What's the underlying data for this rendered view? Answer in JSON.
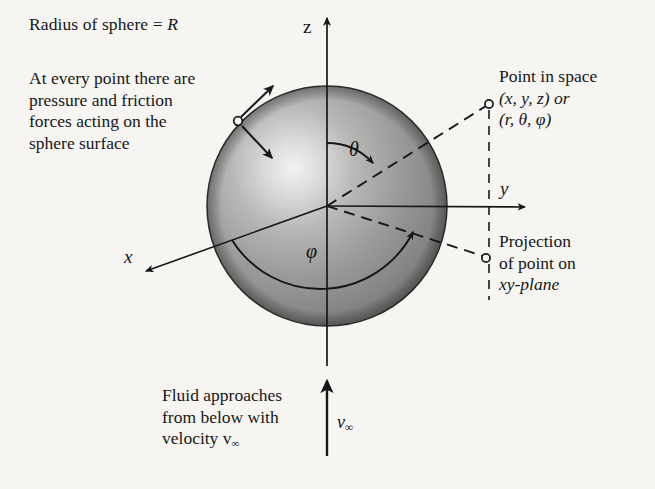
{
  "figure": {
    "background_color": "#f6f5f1",
    "ink_color": "#17171a"
  },
  "annotations": {
    "radius_note": "Radius of sphere = ",
    "radius_symbol": "R",
    "surface_note_lines": [
      "At every point there are",
      "pressure and friction",
      "forces acting on the",
      "sphere surface"
    ],
    "point_note_lines": [
      "Point in space",
      "(x, y, z) or",
      "(r, θ, φ)"
    ],
    "projection_note_lines": [
      "Projection",
      "of point on",
      "xy-plane"
    ],
    "fluid_note_lines": [
      "Fluid approaches",
      "from below with",
      "velocity v"
    ],
    "fluid_note_velocity_symbol": "v",
    "fluid_note_velocity_subscript": "∞"
  },
  "axes": {
    "z_label": "z",
    "y_label": "y",
    "x_label": "x"
  },
  "angles": {
    "theta_label": "θ",
    "phi_label": "φ"
  },
  "velocity": {
    "symbol": "v",
    "subscript": "∞"
  },
  "geometry": {
    "sphere_center_x": 327,
    "sphere_center_y": 206,
    "sphere_radius": 120,
    "sphere_fill_light": "#e9e9e9",
    "sphere_fill_mid": "#9a9a9a",
    "sphere_fill_dark": "#6f6f6f",
    "point_in_space_x": 489,
    "point_in_space_y": 104,
    "projection_point_x": 486,
    "projection_point_y": 258,
    "surface_point_x": 238,
    "surface_point_y": 121,
    "z_axis_tip_y": 15,
    "y_axis_tip_x": 529,
    "x_axis_tip_x": 142,
    "x_axis_tip_y": 274,
    "velocity_arrow_x": 327,
    "velocity_arrow_tail_y": 456,
    "velocity_arrow_tip_y": 379
  }
}
